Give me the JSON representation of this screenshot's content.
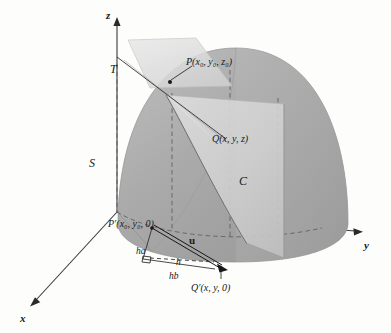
{
  "figure": {
    "type": "math-3d-diagram",
    "background_color": "#fdfdfc",
    "surface_color": "#a8a8a8",
    "surface_light_color": "#c6c6c6",
    "plane_color": "#dcdcdc",
    "line_color": "#2a2a2c"
  },
  "axes": {
    "z": {
      "label": "z",
      "x": 106,
      "y": 10
    },
    "y": {
      "label": "y",
      "x": 364,
      "y": 240
    },
    "x": {
      "label": "x",
      "x": 20,
      "y": 313
    }
  },
  "labels": {
    "surface": {
      "text": "S",
      "x": 89,
      "y": 157
    },
    "tangent_plane": {
      "text": "T",
      "x": 110,
      "y": 63
    },
    "curve": {
      "text": "C",
      "x": 239,
      "y": 175
    },
    "vector_u": {
      "text": "u",
      "x": 189,
      "y": 235
    },
    "seg_ha": {
      "text": "ha",
      "x": 136,
      "y": 247
    },
    "seg_h": {
      "text": "h",
      "x": 176,
      "y": 258
    },
    "seg_hb": {
      "text": "hb",
      "x": 169,
      "y": 272
    }
  },
  "points": {
    "P": {
      "name": "P",
      "coords": "(x0, y0, z0)",
      "prefix": "P(",
      "x": 186,
      "y": 57
    },
    "Q": {
      "name": "Q",
      "coords": "(x, y, z)",
      "prefix": "Q(",
      "x": 212,
      "y": 134
    },
    "P_prime": {
      "name": "P'",
      "coords": "(x0, y0, 0)",
      "prefix": "P′(",
      "x": 108,
      "y": 219
    },
    "Q_prime": {
      "name": "Q'",
      "coords": "(x, y, 0)",
      "prefix": "Q′(",
      "x": 191,
      "y": 283
    }
  },
  "text": {
    "P_label_parts": {
      "head": "P(",
      "x0": "x",
      "sub0": "0",
      "sep": ", ",
      "y0": "y",
      "z0": "z",
      "tail": ")"
    },
    "Q_label": "Q(x, y, z)",
    "P_prime_label": "P′(x₀, y₀, 0)",
    "Q_prime_label": "Q′(x, y, 0)",
    "P_label": "P(x₀, y₀, z₀)"
  }
}
